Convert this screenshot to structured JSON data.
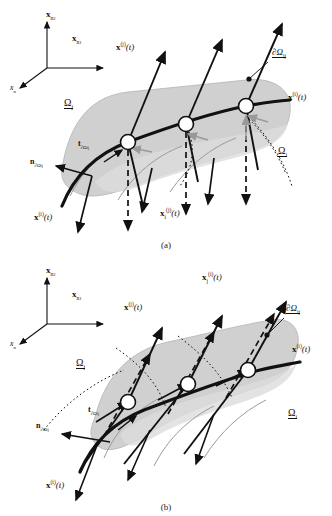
{
  "figure": {
    "type": "scientific-diagram",
    "panels": [
      {
        "id": "a",
        "caption": "(a)",
        "axes": {
          "vertical_label": "x",
          "vertical_sub": "n",
          "vertical_sub2": "2",
          "horizontal_label": "x",
          "horizontal_sub": "n",
          "horizontal_sub2": "1",
          "depth_label": "x",
          "depth_sub": "n"
        },
        "labels": {
          "trajectory_j": "x",
          "trajectory_j_sup": "(j)",
          "trajectory_j_arg": "(t)",
          "trajectory_i_right": "x",
          "trajectory_i_right_sup": "(i)",
          "trajectory_i_right_arg": "(t)",
          "trajectory_i_bottom": "x",
          "trajectory_i_bottom_sup": "(i)",
          "trajectory_i_bottom_arg": "(t)",
          "projected": "x",
          "projected_sub": "i",
          "projected_sup": "(j)",
          "projected_arg": "(t)",
          "boundary": "∂Ω",
          "boundary_sub": "ij",
          "domain_upper": "Ω",
          "domain_upper_sub": "j",
          "domain_lower": "Ω",
          "domain_lower_sub": "i",
          "normal": "n",
          "normal_sub": "∂Ω",
          "normal_sub2": "ij",
          "tangent": "t",
          "tangent_sub": "∂Ω",
          "tangent_sub2": "ij"
        }
      },
      {
        "id": "b",
        "caption": "(b)",
        "axes": {
          "vertical_label": "x",
          "vertical_sub": "n",
          "vertical_sub2": "2",
          "horizontal_label": "x",
          "horizontal_sub": "n",
          "horizontal_sub2": "1",
          "depth_label": "x",
          "depth_sub": "n"
        },
        "labels": {
          "trajectory_j": "x",
          "trajectory_j_sup": "(j)",
          "trajectory_j_arg": "(t)",
          "trajectory_i_right": "x",
          "trajectory_i_right_sup": "(i)",
          "trajectory_i_right_arg": "(t)",
          "trajectory_i_bottom": "x",
          "trajectory_i_bottom_sup": "(i)",
          "trajectory_i_bottom_arg": "(t)",
          "projected": "x",
          "projected_sub": "j",
          "projected_sup": "(i)",
          "projected_arg": "(t)",
          "boundary": "∂Ω",
          "boundary_sub": "ij",
          "domain_upper": "Ω",
          "domain_upper_sub": "j",
          "domain_lower": "Ω",
          "domain_lower_sub": "i",
          "normal": "n",
          "normal_sub": "∂Ω",
          "normal_sub2": "ij",
          "tangent": "t",
          "tangent_sub": "∂Ω",
          "tangent_sub2": "ij"
        }
      }
    ],
    "colors": {
      "surface_fill": "#c8c8c8",
      "surface_fill_light": "#dcdcdc",
      "stroke": "#111111",
      "gray_curve": "#9a9a9a",
      "marker_fill": "#ffffff",
      "background": "#ffffff"
    }
  }
}
